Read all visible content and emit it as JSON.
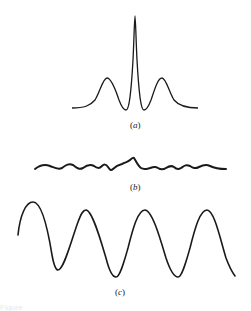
{
  "figure": {
    "stroke_color": "#1a1a1a",
    "panels": [
      {
        "id": "a",
        "label_open": "(",
        "label_letter": "a",
        "label_close": ")",
        "description": "central peak with two side lobes (sinc-squared-like pattern)"
      },
      {
        "id": "b",
        "label_open": "(",
        "label_letter": "b",
        "label_close": ")",
        "description": "low-amplitude noisy wavy line with small central bump"
      },
      {
        "id": "c",
        "label_open": "(",
        "label_letter": "c",
        "label_close": ")",
        "description": "large-amplitude periodic sinusoid"
      }
    ],
    "caption_fragment": "Figure"
  }
}
